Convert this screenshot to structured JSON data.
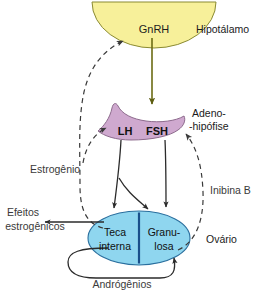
{
  "diagram": {
    "organs": {
      "hypothalamus": {
        "label": "Hipotálamo",
        "hormone": "GnRH",
        "color": "#f7f09a"
      },
      "pituitary": {
        "label_line1": "Adeno-",
        "label_line2": "-hipófise",
        "hormone_lh": "LH",
        "hormone_fsh": "FSH",
        "color": "#cfa9cf"
      },
      "ovary": {
        "label": "Ovário",
        "compartment_theca_line1": "Teca",
        "compartment_theca_line2": "interna",
        "compartment_granulosa_line1": "Granu-",
        "compartment_granulosa_line2": "losa",
        "color": "#8fd6ef"
      }
    },
    "signals": {
      "estrogen": "Estrogênio",
      "inhibin": "Inibina B",
      "androgens": "Andrógênios",
      "estrogenic_effects_line1": "Efeitos",
      "estrogenic_effects_line2": "estrogênicos"
    },
    "colors": {
      "hypothalamus_fill": "#f7f09a",
      "hypothalamus_stroke": "#8a8a33",
      "pituitary_fill": "#cfa9cf",
      "pituitary_stroke": "#8d6b8d",
      "ovary_fill": "#8fd6ef",
      "ovary_stroke": "#2a6f9e",
      "ovary_divider": "#1a4f8a",
      "gnrh_arrow": "#6b6b14",
      "solid_arrow": "#2b2b2b",
      "dashed_arrow": "#3a3a3a",
      "text": "#2a2a2a"
    }
  }
}
